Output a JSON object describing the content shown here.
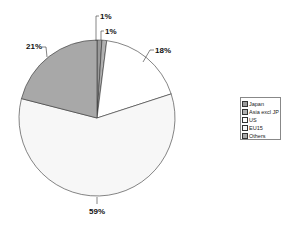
{
  "chart_data": {
    "type": "pie",
    "title": "",
    "categories": [
      "Japan",
      "Asia excl JP",
      "US",
      "EU15",
      "Others"
    ],
    "values": [
      1,
      1,
      18,
      59,
      21
    ],
    "data_labels": [
      "1%",
      "1%",
      "18%",
      "59%",
      "21%"
    ],
    "colors": [
      "#9a9a9a",
      "#b0b0b0",
      "#ffffff",
      "#f7f7f7",
      "#a8a8a8"
    ],
    "start_angle_deg": 0,
    "direction": "clockwise",
    "legend_position": "right"
  },
  "legend": {
    "items": [
      {
        "label": "Japan",
        "color": "#9a9a9a"
      },
      {
        "label": "Asia excl JP",
        "color": "#b0b0b0"
      },
      {
        "label": "US",
        "color": "#ffffff"
      },
      {
        "label": "EU15",
        "color": "#f7f7f7"
      },
      {
        "label": "Others",
        "color": "#a8a8a8"
      }
    ]
  }
}
